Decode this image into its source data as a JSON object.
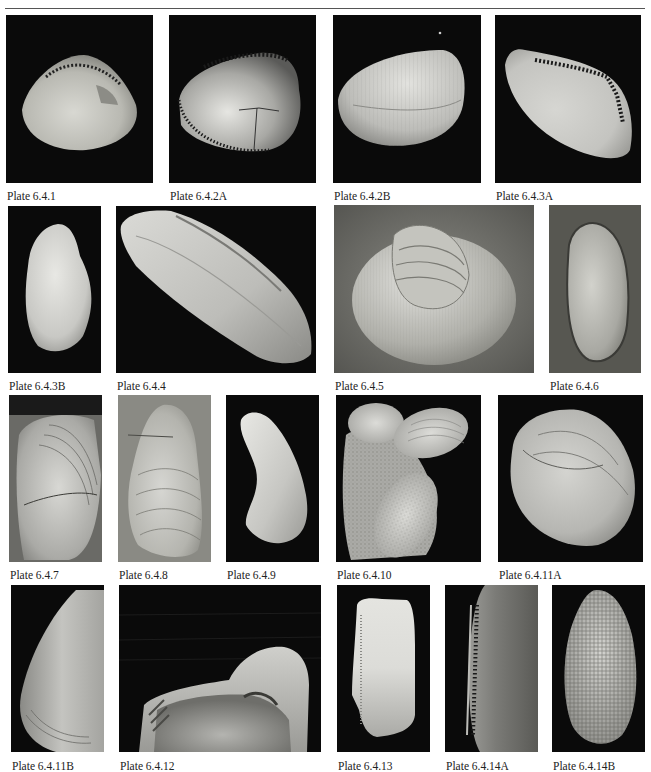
{
  "page": {
    "running_head": "",
    "rule_color": "#555555"
  },
  "plates": [
    {
      "id": "6.4.1",
      "caption": "Plate 6.4.1",
      "background": "dark",
      "subject": "clam-interior-with-hinge-teeth"
    },
    {
      "id": "6.4.2A",
      "caption": "Plate 6.4.2A",
      "background": "dark",
      "subject": "clam-interior-crenulated-margin"
    },
    {
      "id": "6.4.2B",
      "caption": "Plate 6.4.2B",
      "background": "dark",
      "subject": "clam-exterior-ribbed"
    },
    {
      "id": "6.4.3A",
      "caption": "Plate 6.4.3A",
      "background": "dark",
      "subject": "elongate-clam-interior-with-teeth"
    },
    {
      "id": "6.4.3B",
      "caption": "Plate 6.4.3B",
      "background": "dark",
      "subject": "oval-shell-exterior"
    },
    {
      "id": "6.4.4",
      "caption": "Plate 6.4.4",
      "background": "dark",
      "subject": "elongate-shell-diagonal"
    },
    {
      "id": "6.4.5",
      "caption": "Plate 6.4.5",
      "background": "matrix",
      "subject": "ribbed-shell-in-rock"
    },
    {
      "id": "6.4.6",
      "caption": "Plate 6.4.6",
      "background": "matrix",
      "subject": "oval-mold-in-rock"
    },
    {
      "id": "6.4.7",
      "caption": "Plate 6.4.7",
      "background": "matrix",
      "subject": "mussel-like-shell-growth-lines"
    },
    {
      "id": "6.4.8",
      "caption": "Plate 6.4.8",
      "background": "matrix",
      "subject": "mytilid-shell-growth-lines"
    },
    {
      "id": "6.4.9",
      "caption": "Plate 6.4.9",
      "background": "dark",
      "subject": "curved-mussel-shell"
    },
    {
      "id": "6.4.10",
      "caption": "Plate 6.4.10",
      "background": "dark",
      "subject": "shell-cluster-with-boring"
    },
    {
      "id": "6.4.11A",
      "caption": "Plate 6.4.11A",
      "background": "dark",
      "subject": "oyster-like-shell"
    },
    {
      "id": "6.4.11B",
      "caption": "Plate 6.4.11B",
      "background": "dark",
      "subject": "shell-umbo-closeup"
    },
    {
      "id": "6.4.12",
      "caption": "Plate 6.4.12",
      "background": "dark",
      "subject": "hinge-interior-closeup"
    },
    {
      "id": "6.4.13",
      "caption": "Plate 6.4.13",
      "background": "dark",
      "subject": "elongate-shell-interior"
    },
    {
      "id": "6.4.14A",
      "caption": "Plate 6.4.14A",
      "background": "dark",
      "subject": "shell-hinge-teeth-closeup"
    },
    {
      "id": "6.4.14B",
      "caption": "Plate 6.4.14B",
      "background": "dark",
      "subject": "reticulate-sculptured-shell"
    }
  ]
}
